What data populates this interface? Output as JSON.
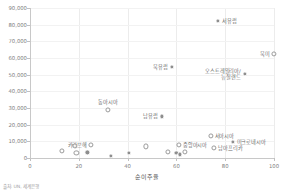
{
  "chart_data": {
    "type": "scatter",
    "title": "",
    "xlabel": "순이주율",
    "ylabel": "",
    "xlim": [
      0,
      100
    ],
    "ylim": [
      0,
      90000
    ],
    "grid": true,
    "legend": null,
    "source": "출처: UN, 세계은행",
    "x_ticks": [
      "0",
      "20",
      "40",
      "60",
      "80",
      "100"
    ],
    "x_tick_values": [
      0,
      20,
      40,
      60,
      80,
      100
    ],
    "y_ticks": [
      "0",
      "10,000",
      "20,000",
      "30,000",
      "40,000",
      "50,000",
      "60,000",
      "70,000",
      "80,000",
      "90,000"
    ],
    "y_tick_values": [
      0,
      10000,
      20000,
      30000,
      40000,
      50000,
      60000,
      70000,
      80000,
      90000
    ],
    "points": [
      {
        "label": "서유럽",
        "x": 77.0,
        "y": 82500,
        "label_pos": "right",
        "style": "filled"
      },
      {
        "label": "북미",
        "x": 100.0,
        "y": 62500,
        "label_pos": "left",
        "style": "ring"
      },
      {
        "label": "북유럽",
        "x": 58.0,
        "y": 54500,
        "label_pos": "left",
        "style": "filled"
      },
      {
        "label": "오스트레일리아/\n뉴질랜드",
        "x": 88.0,
        "y": 50500,
        "label_pos": "left-2line",
        "style": "filled"
      },
      {
        "label": "동아시아",
        "x": 32.0,
        "y": 29000,
        "label_pos": "above",
        "style": "ring"
      },
      {
        "label": "남유럽",
        "x": 54.0,
        "y": 25000,
        "label_pos": "left",
        "style": "filled"
      },
      {
        "label": "서아시아",
        "x": 74.0,
        "y": 13500,
        "label_pos": "right",
        "style": "ring"
      },
      {
        "label": "미크로네시아",
        "x": 83.0,
        "y": 9500,
        "label_pos": "right",
        "style": "filled"
      },
      {
        "label": "남아프리카",
        "x": 75.5,
        "y": 6000,
        "label_pos": "right",
        "style": "ring"
      },
      {
        "label": "카리브해",
        "x": 25.0,
        "y": 8000,
        "label_pos": "left",
        "style": "ring"
      },
      {
        "label": "중앙아시아",
        "x": 61.0,
        "y": 8000,
        "label_pos": "right",
        "style": "ring"
      },
      {
        "label": "",
        "x": 18.5,
        "y": 7200,
        "label_pos": "none",
        "style": "ring"
      },
      {
        "label": "",
        "x": 13.0,
        "y": 4200,
        "label_pos": "none",
        "style": "ring"
      },
      {
        "label": "",
        "x": 19.0,
        "y": 3200,
        "label_pos": "none",
        "style": "ring"
      },
      {
        "label": "",
        "x": 23.5,
        "y": 3400,
        "label_pos": "none",
        "style": "filled"
      },
      {
        "label": "",
        "x": 40.5,
        "y": 3000,
        "label_pos": "none",
        "style": "filled"
      },
      {
        "label": "",
        "x": 47.5,
        "y": 7000,
        "label_pos": "none",
        "style": "ring"
      },
      {
        "label": "",
        "x": 56.5,
        "y": 3600,
        "label_pos": "none",
        "style": "ring"
      },
      {
        "label": "",
        "x": 60.0,
        "y": 3200,
        "label_pos": "none",
        "style": "filled"
      },
      {
        "label": "",
        "x": 63.5,
        "y": 3600,
        "label_pos": "none",
        "style": "ring"
      },
      {
        "label": "",
        "x": 61.5,
        "y": 2200,
        "label_pos": "none",
        "style": "filled"
      },
      {
        "label": "",
        "x": 33.0,
        "y": 1200,
        "label_pos": "none",
        "style": "filled"
      }
    ]
  }
}
